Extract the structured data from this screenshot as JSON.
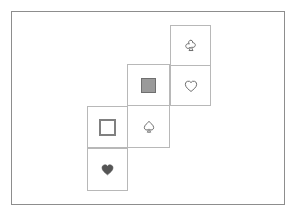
{
  "frame": {
    "border_color": "#8d8d8d",
    "background": "#ffffff"
  },
  "board": {
    "cell_border_color": "#b8b8b8",
    "cell_size": 41,
    "description": "Diagonal staircase of six overlapping square cells, each holding one token",
    "cells": [
      {
        "id": "cell-club",
        "name": "cell-top-right",
        "row": 0,
        "col": 2,
        "x": 170,
        "y": 25,
        "width": 41,
        "height": 41,
        "token": "club",
        "token_label": "♣",
        "token_style": "outline",
        "token_color": "#6e6e6e"
      },
      {
        "id": "cell-heart-outline",
        "name": "cell-right-middle",
        "row": 1,
        "col": 2,
        "x": 170,
        "y": 65,
        "width": 41,
        "height": 41,
        "token": "heart",
        "token_label": "♡",
        "token_style": "outline",
        "token_color": "#6e6e6e"
      },
      {
        "id": "cell-square-gray",
        "name": "cell-middle-left",
        "row": 1,
        "col": 1,
        "x": 127,
        "y": 64,
        "width": 43,
        "height": 42,
        "token": "filled-square",
        "token_label": "■",
        "token_style": "filled",
        "token_color": "#9a9a9a"
      },
      {
        "id": "cell-spade",
        "name": "cell-middle-lower",
        "row": 2,
        "col": 1,
        "x": 127,
        "y": 105,
        "width": 43,
        "height": 43,
        "token": "spade",
        "token_label": "♠",
        "token_style": "outline",
        "token_color": "#6e6e6e"
      },
      {
        "id": "cell-square-white",
        "name": "cell-lower-left",
        "row": 2,
        "col": 0,
        "x": 87,
        "y": 106,
        "width": 41,
        "height": 42,
        "token": "outlined-square",
        "token_label": "□",
        "token_style": "outline",
        "token_color": "#808080"
      },
      {
        "id": "cell-heart-filled",
        "name": "cell-bottom-left",
        "row": 3,
        "col": 0,
        "x": 87,
        "y": 148,
        "width": 41,
        "height": 43,
        "token": "filled-heart",
        "token_label": "♥",
        "token_style": "filled",
        "token_color": "#555555"
      }
    ]
  }
}
